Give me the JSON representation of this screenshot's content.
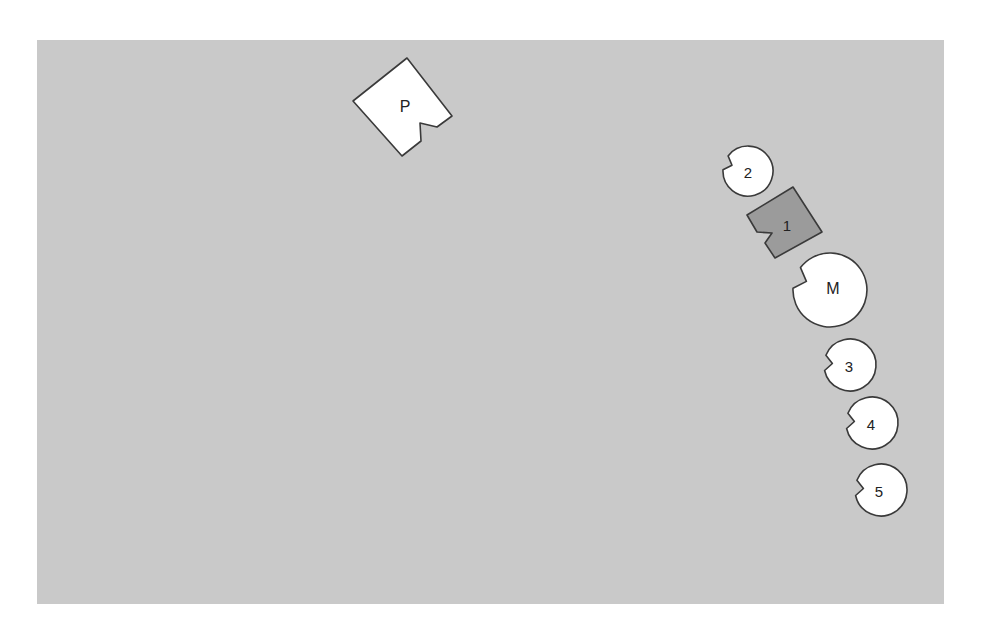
{
  "diagram": {
    "background_color": "#c9c9c9",
    "outline_color": "#3a3a3a",
    "shapes": [
      {
        "id": "P",
        "label": "P",
        "kind": "notched-square",
        "fill": "#ffffff",
        "points": "407,58 452,116 437,127 420,123 421,141 402,156 353,101",
        "label_x": 405,
        "label_y": 106
      },
      {
        "id": "2",
        "label": "2",
        "kind": "notched-circle",
        "fill": "#ffffff",
        "cx": 748,
        "cy": 171,
        "r": 25,
        "notch_angle": 200,
        "label_x": 748,
        "label_y": 172
      },
      {
        "id": "1",
        "label": "1",
        "kind": "notched-square",
        "fill": "#9b9b9b",
        "points": "793,187 822,232 775,258 765,243 772,233 757,232 747,215",
        "label_x": 787,
        "label_y": 225
      },
      {
        "id": "M",
        "label": "M",
        "kind": "notched-circle",
        "fill": "#ffffff",
        "cx": 830,
        "cy": 290,
        "r": 37,
        "notch_angle": 200,
        "label_x": 833,
        "label_y": 288
      },
      {
        "id": "3",
        "label": "3",
        "kind": "notched-circle",
        "fill": "#ffffff",
        "cx": 850,
        "cy": 365,
        "r": 26,
        "notch_angle": 185,
        "label_x": 849,
        "label_y": 366
      },
      {
        "id": "4",
        "label": "4",
        "kind": "notched-circle",
        "fill": "#ffffff",
        "cx": 872,
        "cy": 423,
        "r": 26,
        "notch_angle": 185,
        "label_x": 871,
        "label_y": 424
      },
      {
        "id": "5",
        "label": "5",
        "kind": "notched-circle",
        "fill": "#ffffff",
        "cx": 881,
        "cy": 490,
        "r": 26,
        "notch_angle": 185,
        "label_x": 879,
        "label_y": 491
      }
    ]
  }
}
